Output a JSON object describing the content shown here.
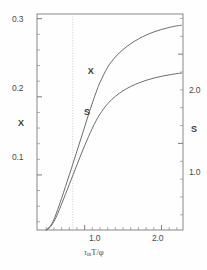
{
  "chart_data": {
    "type": "line",
    "title": "",
    "xlabel": "τ in T/φ",
    "xlabel_parts": {
      "tau": "τ",
      "in": "in",
      "main": "T/φ"
    },
    "ylabel_left": "X",
    "ylabel_right": "S",
    "xlim": [
      0.38,
      2.28
    ],
    "ylim_left": [
      0.0295,
      0.306
    ],
    "ylim_right": [
      0.03,
      2.45
    ],
    "grid": false,
    "legend": "inline-curve-labels",
    "x_ticks": [
      {
        "value": 1.0,
        "label": "1.0"
      },
      {
        "value": 2.0,
        "label": "2.0"
      }
    ],
    "x_minor_ticks": [
      0.5,
      0.6,
      0.7,
      0.8,
      0.9,
      1.1,
      1.2,
      1.3,
      1.4,
      1.5,
      1.6,
      1.7,
      1.8,
      1.9,
      2.1,
      2.2
    ],
    "y_ticks_left": [
      {
        "value": 0.3,
        "label": "0.3"
      },
      {
        "value": 0.2,
        "label": "0.2"
      },
      {
        "value": 0.1,
        "label": "0.1"
      }
    ],
    "y_minor_ticks_left": [
      0.12,
      0.14,
      0.16,
      0.18,
      0.22,
      0.24,
      0.26,
      0.28,
      0.08,
      0.06,
      0.04
    ],
    "y_ticks_right": [
      {
        "value": 2.0,
        "label": "2.0"
      },
      {
        "value": 1.0,
        "label": "1.0"
      }
    ],
    "y_minor_ticks_right": [
      0.2,
      0.4,
      0.6,
      0.8,
      1.2,
      1.4,
      1.6,
      1.8,
      2.2,
      2.4
    ],
    "annotations": [
      {
        "name": "reference-line",
        "type": "vertical-dotted",
        "x": 0.845
      }
    ],
    "series": [
      {
        "name": "X",
        "label": "X",
        "axis": "left",
        "color": "#6d6d6d",
        "label_x": 1.12,
        "label_y": 0.232,
        "x": [
          0.5,
          0.55,
          0.6,
          0.65,
          0.7,
          0.75,
          0.8,
          0.85,
          0.9,
          0.95,
          1.0,
          1.05,
          1.1,
          1.15,
          1.2,
          1.3,
          1.4,
          1.5,
          1.6,
          1.7,
          1.8,
          1.9,
          2.0,
          2.1,
          2.2,
          2.26
        ],
        "y": [
          0.03,
          0.034,
          0.043,
          0.056,
          0.07,
          0.085,
          0.1,
          0.115,
          0.1305,
          0.146,
          0.1615,
          0.177,
          0.192,
          0.206,
          0.2185,
          0.238,
          0.251,
          0.2605,
          0.268,
          0.274,
          0.279,
          0.283,
          0.2862,
          0.2888,
          0.2908,
          0.2916
        ]
      },
      {
        "name": "S",
        "label": "S",
        "axis": "right",
        "color": "#6d6d6d",
        "label_x": 1.07,
        "label_y": 1.34,
        "x": [
          0.5,
          0.55,
          0.6,
          0.65,
          0.7,
          0.75,
          0.8,
          0.85,
          0.9,
          0.95,
          1.0,
          1.05,
          1.1,
          1.15,
          1.2,
          1.3,
          1.4,
          1.5,
          1.6,
          1.7,
          1.8,
          1.9,
          2.0,
          2.1,
          2.2,
          2.26
        ],
        "y": [
          0.03,
          0.06,
          0.125,
          0.215,
          0.32,
          0.43,
          0.54,
          0.65,
          0.76,
          0.87,
          0.975,
          1.075,
          1.17,
          1.255,
          1.33,
          1.445,
          1.528,
          1.59,
          1.638,
          1.676,
          1.707,
          1.732,
          1.752,
          1.768,
          1.782,
          1.788
        ]
      }
    ]
  },
  "figure": {
    "frame": {
      "left": 37,
      "right": 183,
      "top": 14,
      "bottom": 230
    }
  }
}
